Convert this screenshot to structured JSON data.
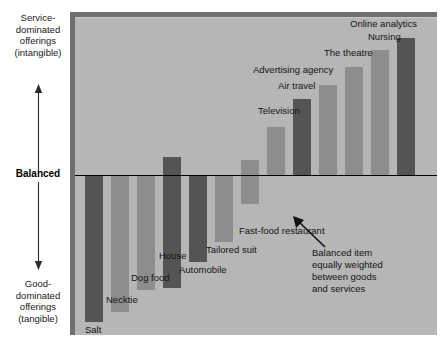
{
  "axis": {
    "top_label": "Service-\ndominated\nofferings\n(intangible)",
    "mid_label": "Balanced",
    "bottom_label": "Good-\ndominated\nofferings\n(tangible)",
    "up_arrow_icon": "arrow-up-icon",
    "down_arrow_icon": "arrow-down-icon"
  },
  "annotation": {
    "text": "Balanced item\nequally weighted\nbetween goods\nand services",
    "pointer_icon": "callout-arrow-icon",
    "target": "Fast-food restaurant"
  },
  "colors": {
    "plot_background": "#b6b6b6",
    "frame_edge": "#6f6f6f",
    "bar_dark": "#545454",
    "bar_light": "#8d8d8d",
    "zero_line": "#000000",
    "text": "#141414"
  },
  "chart_data": {
    "type": "bar",
    "title": "",
    "xlabel": "",
    "ylabel": "Service / Good dominance",
    "ylim": [
      -5,
      5
    ],
    "grid": false,
    "legend_position": "none",
    "zero_line_label": "Balanced",
    "axis_top_label": "Service-dominated offerings (intangible)",
    "axis_bottom_label": "Good-dominated offerings (tangible)",
    "categories": [
      "Salt",
      "Necktie",
      "Dog food",
      "House",
      "Automobile",
      "Tailored suit",
      "Fast-food restaurant",
      "Television",
      "Air travel",
      "Advertising agency",
      "The theatre",
      "Nursing",
      "Online analytics"
    ],
    "values": [
      -4.6,
      -4.3,
      -3.6,
      -3.3,
      -2.7,
      -2.1,
      -0.9,
      0.7,
      2.1,
      2.6,
      3.3,
      4.0,
      4.5
    ],
    "bar_shades": [
      "dark",
      "light",
      "light",
      "dark",
      "dark",
      "light",
      "light",
      "light",
      "dark",
      "light",
      "light",
      "light",
      "dark"
    ],
    "annotations": [
      {
        "text": "Balanced item equally weighted between goods and services",
        "points_to": "Fast-food restaurant"
      }
    ]
  },
  "bars": [
    {
      "label": "Salt",
      "shade": "dark",
      "x": 10,
      "w": 18,
      "top": 159,
      "bottom": 305,
      "label_x": 10,
      "label_y": 307
    },
    {
      "label": "Necktie",
      "shade": "light",
      "x": 36,
      "w": 18,
      "top": 159,
      "bottom": 295,
      "label_x": 31,
      "label_y": 277
    },
    {
      "label": "Dog food",
      "shade": "light",
      "x": 62,
      "w": 18,
      "top": 159,
      "bottom": 273,
      "label_x": 56,
      "label_y": 255
    },
    {
      "label": "House",
      "shade": "dark",
      "x": 88,
      "w": 18,
      "top": 140,
      "bottom": 271,
      "label_x": 84,
      "label_y": 233
    },
    {
      "label": "Automobile",
      "shade": "dark",
      "x": 114,
      "w": 18,
      "top": 159,
      "bottom": 245,
      "label_x": 104,
      "label_y": 247
    },
    {
      "label": "Tailored suit",
      "shade": "light",
      "x": 140,
      "w": 18,
      "top": 159,
      "bottom": 225,
      "label_x": 131,
      "label_y": 227
    },
    {
      "label": "Fast-food restaurant",
      "shade": "light",
      "x": 166,
      "w": 18,
      "top": 143,
      "bottom": 187,
      "label_x": 164,
      "label_y": 208
    },
    {
      "label": "Television",
      "shade": "light",
      "x": 192,
      "w": 18,
      "top": 110,
      "bottom": 159,
      "label_x": 183,
      "label_y": 88
    },
    {
      "label": "Air travel",
      "shade": "dark",
      "x": 218,
      "w": 18,
      "top": 82,
      "bottom": 159,
      "label_x": 203,
      "label_y": 63
    },
    {
      "label": "Advertising agency",
      "shade": "light",
      "x": 244,
      "w": 18,
      "top": 68,
      "bottom": 159,
      "label_x": 178,
      "label_y": 47
    },
    {
      "label": "The theatre",
      "shade": "light",
      "x": 270,
      "w": 18,
      "top": 50,
      "bottom": 159,
      "label_x": 249,
      "label_y": 30
    },
    {
      "label": "Nursing",
      "shade": "light",
      "x": 296,
      "w": 18,
      "top": 33,
      "bottom": 159,
      "label_x": 293,
      "label_y": 14
    },
    {
      "label": "Online analytics",
      "shade": "dark",
      "x": 322,
      "w": 18,
      "top": 21,
      "bottom": 159,
      "label_x": 275,
      "label_y": 1
    }
  ]
}
